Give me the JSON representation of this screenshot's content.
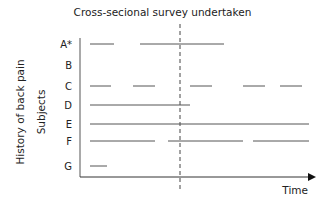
{
  "title": "Cross-secional survey undertaken",
  "ylabel_outer": "History of back pain",
  "ylabel_inner": "Subjects",
  "xlabel": "Time",
  "chart_data": {
    "type": "timeline",
    "title": "Cross-secional survey undertaken",
    "xlabel": "Time",
    "ylabel": "History of back pain / Subjects",
    "survey_time_x": 180,
    "rows": [
      {
        "label": "A*",
        "y": 44,
        "segments": [
          [
            90,
            114
          ],
          [
            140,
            224
          ]
        ]
      },
      {
        "label": "B",
        "y": 65,
        "segments": []
      },
      {
        "label": "C",
        "y": 86,
        "segments": [
          [
            90,
            111
          ],
          [
            133,
            155
          ],
          [
            190,
            212
          ],
          [
            243,
            265
          ],
          [
            280,
            302
          ]
        ]
      },
      {
        "label": "D",
        "y": 105,
        "segments": [
          [
            90,
            190
          ]
        ]
      },
      {
        "label": "E",
        "y": 124,
        "segments": [
          [
            90,
            309
          ]
        ]
      },
      {
        "label": "F",
        "y": 141,
        "segments": [
          [
            90,
            155
          ],
          [
            168,
            243
          ],
          [
            253,
            309
          ]
        ]
      },
      {
        "label": "G",
        "y": 166,
        "segments": [
          [
            90,
            107
          ]
        ]
      }
    ]
  }
}
